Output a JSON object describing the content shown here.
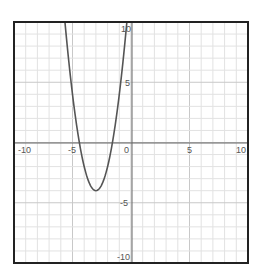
{
  "chart_data": {
    "type": "line",
    "title": "",
    "xlabel": "",
    "ylabel": "",
    "xlim": [
      -10,
      10
    ],
    "ylim": [
      -10,
      10
    ],
    "grid": true,
    "grid_step": 1,
    "x_ticks": [
      "-10",
      "-5",
      "0",
      "5",
      "10"
    ],
    "y_ticks": [
      "10",
      "5",
      "-5",
      "-10"
    ],
    "series": [
      {
        "name": "parabola",
        "equation": "y = 2(x+3)^2 - 4",
        "vertex": [
          -3,
          -4
        ],
        "x_intercepts": [
          -4.4,
          -1.6
        ],
        "x": [
          -5.65,
          -5,
          -4.5,
          -4,
          -3.5,
          -3,
          -2.5,
          -2,
          -1.5,
          -1,
          -0.35
        ],
        "values": [
          10,
          4,
          0.5,
          -2,
          -3.5,
          -4,
          -3.5,
          -2,
          0.5,
          4,
          10
        ],
        "color": "#555555"
      }
    ]
  },
  "labels": {
    "x_neg10": "-10",
    "x_neg5": "-5",
    "x_0": "0",
    "x_5": "5",
    "x_10": "10",
    "y_10": "10",
    "y_5": "5",
    "y_neg5": "-5",
    "y_neg10": "-10"
  }
}
